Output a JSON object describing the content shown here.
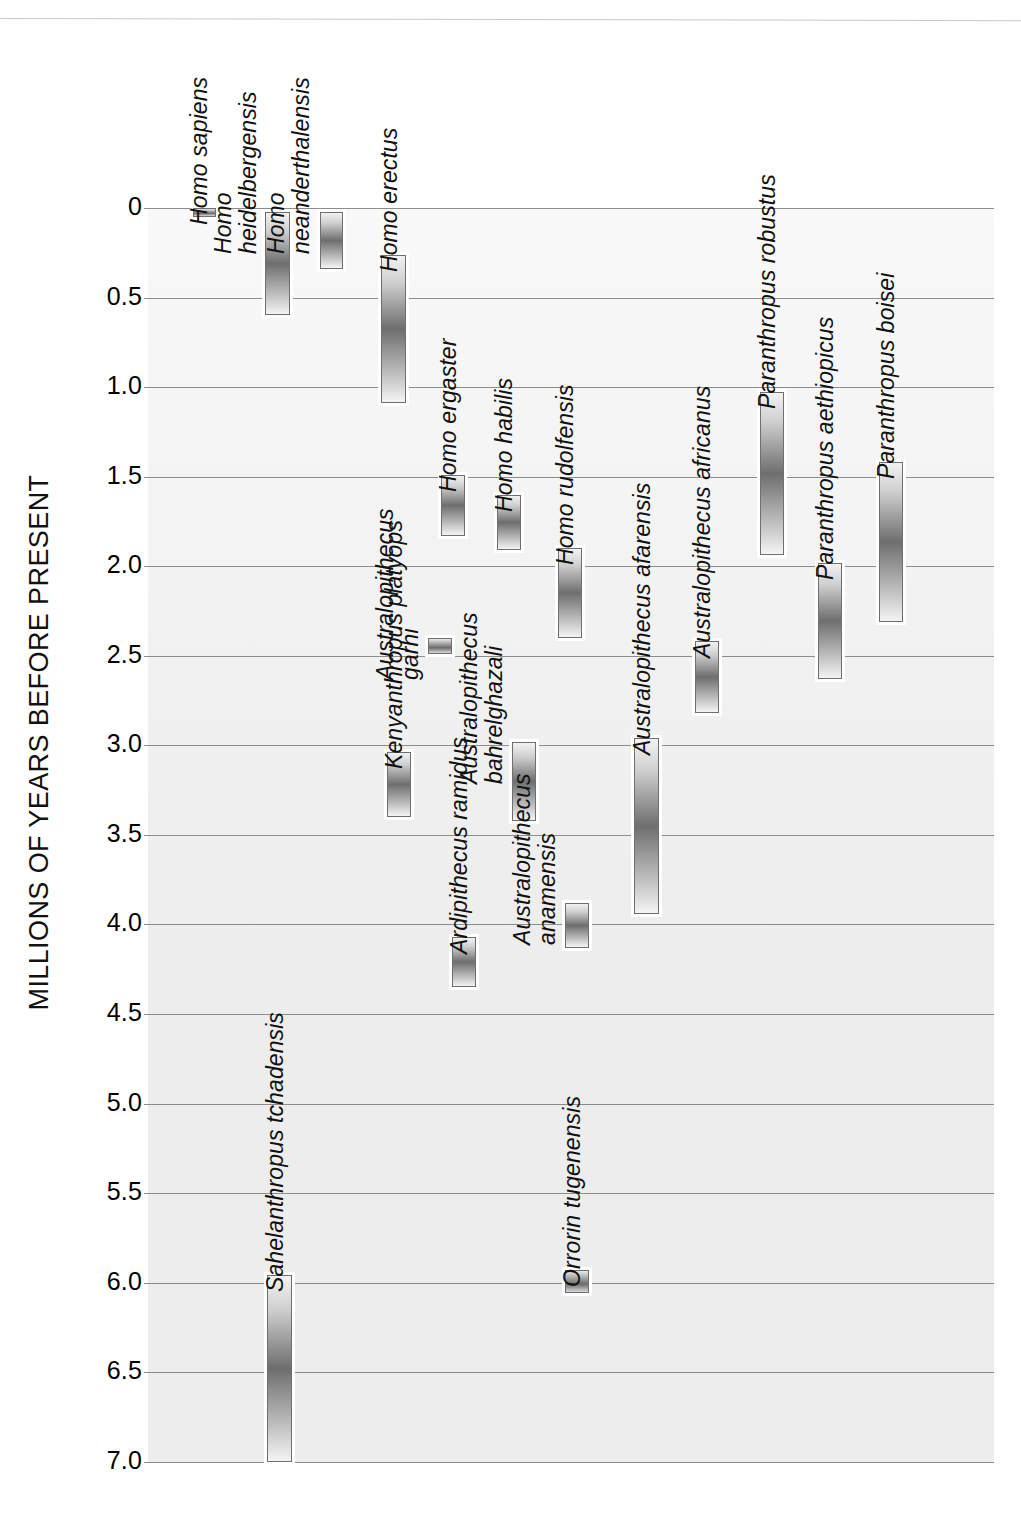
{
  "figure": {
    "axis_title": "MILLIONS OF YEARS BEFORE PRESENT",
    "plot_background": "#ededed",
    "gridline_color": "#8d8d8d",
    "bar_outline_color": "#6f6f6f"
  },
  "chart_data": {
    "type": "bar",
    "orientation": "vertical-ranges",
    "title": "",
    "xlabel": "",
    "ylabel": "MILLIONS OF YEARS BEFORE PRESENT",
    "ylim": [
      0,
      7.0
    ],
    "y_inverted": true,
    "grid": true,
    "legend": "none",
    "tick_labels": [
      "0",
      "0.5",
      "1.0",
      "1.5",
      "2.0",
      "2.5",
      "3.0",
      "3.5",
      "4.0",
      "4.5",
      "5.0",
      "5.5",
      "6.0",
      "6.5",
      "7.0"
    ],
    "tick_values": [
      0,
      0.5,
      1.0,
      1.5,
      2.0,
      2.5,
      3.0,
      3.5,
      4.0,
      4.5,
      5.0,
      5.5,
      6.0,
      6.5,
      7.0
    ],
    "units": "millions of years before present",
    "categories": [
      "Homo sapiens",
      "Homo heidelbergensis",
      "Homo neanderthalensis",
      "Homo erectus",
      "Homo ergaster",
      "Homo habilis",
      "Homo rudolfensis",
      "Kenyanthropus platyops",
      "Australopithecus garhi",
      "Ardipithecus ramidus",
      "Australopithecus bahrelghazali",
      "Australopithecus anamensis",
      "Australopithecus afarensis",
      "Australopithecus africanus",
      "Paranthropus robustus",
      "Paranthropus aethiopicus",
      "Paranthropus boisei",
      "Sahelanthropus tchadensis",
      "Orrorin tugenensis"
    ],
    "ranges": [
      {
        "name": "Homo sapiens",
        "label_lines": [
          "Homo sapiens"
        ],
        "start": 0.0,
        "end": 0.05,
        "x": 193,
        "width": 23
      },
      {
        "name": "Homo heidelbergensis",
        "label_lines": [
          "Homo",
          "heidelbergensis"
        ],
        "start": 0.02,
        "end": 0.6,
        "x": 265,
        "width": 25
      },
      {
        "name": "Homo neanderthalensis",
        "label_lines": [
          "Homo",
          "neanderthalensis"
        ],
        "start": 0.02,
        "end": 0.34,
        "x": 320,
        "width": 23
      },
      {
        "name": "Homo erectus",
        "label_lines": [
          "Homo erectus"
        ],
        "start": 0.26,
        "end": 1.09,
        "x": 381,
        "width": 25
      },
      {
        "name": "Homo ergaster",
        "label_lines": [
          "Homo ergaster"
        ],
        "start": 1.49,
        "end": 1.83,
        "x": 441,
        "width": 24
      },
      {
        "name": "Homo habilis",
        "label_lines": [
          "Homo habilis"
        ],
        "start": 1.6,
        "end": 1.91,
        "x": 497,
        "width": 24
      },
      {
        "name": "Homo rudolfensis",
        "label_lines": [
          "Homo rudolfensis"
        ],
        "start": 1.9,
        "end": 2.4,
        "x": 558,
        "width": 24
      },
      {
        "name": "Kenyanthropus platyops",
        "label_lines": [
          "Kenyanthropus platyops"
        ],
        "start": 3.04,
        "end": 3.4,
        "x": 387,
        "width": 24
      },
      {
        "name": "Australopithecus garhi",
        "label_lines": [
          "Australopithecus",
          "garhi"
        ],
        "start": 2.4,
        "end": 2.49,
        "x": 428,
        "width": 24
      },
      {
        "name": "Ardipithecus ramidus",
        "label_lines": [
          "Ardipithecus ramidus"
        ],
        "start": 4.07,
        "end": 4.35,
        "x": 452,
        "width": 24
      },
      {
        "name": "Australopithecus bahrelghazali",
        "label_lines": [
          "Australopithecus",
          "bahrelghazali"
        ],
        "start": 2.98,
        "end": 3.42,
        "x": 512,
        "width": 24
      },
      {
        "name": "Australopithecus anamensis",
        "label_lines": [
          "Australopithecus",
          "anamensis"
        ],
        "start": 3.88,
        "end": 4.13,
        "x": 565,
        "width": 24
      },
      {
        "name": "Australopithecus afarensis",
        "label_lines": [
          "Australopithecus afarensis"
        ],
        "start": 2.96,
        "end": 3.94,
        "x": 634,
        "width": 25
      },
      {
        "name": "Australopithecus africanus",
        "label_lines": [
          "Australopithecus africanus"
        ],
        "start": 2.42,
        "end": 2.82,
        "x": 695,
        "width": 24
      },
      {
        "name": "Paranthropus robustus",
        "label_lines": [
          "Paranthropus robustus"
        ],
        "start": 1.03,
        "end": 1.94,
        "x": 760,
        "width": 24
      },
      {
        "name": "Paranthropus aethiopicus",
        "label_lines": [
          "Paranthropus aethiopicus"
        ],
        "start": 1.98,
        "end": 2.63,
        "x": 818,
        "width": 24
      },
      {
        "name": "Paranthropus boisei",
        "label_lines": [
          "Paranthropus boisei"
        ],
        "start": 1.42,
        "end": 2.31,
        "x": 879,
        "width": 24
      },
      {
        "name": "Sahelanthropus tchadensis",
        "label_lines": [
          "Sahelanthropus tchadensis"
        ],
        "start": 5.96,
        "end": 7.0,
        "x": 267,
        "width": 25
      },
      {
        "name": "Orrorin tugenensis",
        "label_lines": [
          "Orrorin tugenensis"
        ],
        "start": 5.93,
        "end": 6.06,
        "x": 565,
        "width": 24
      }
    ]
  }
}
